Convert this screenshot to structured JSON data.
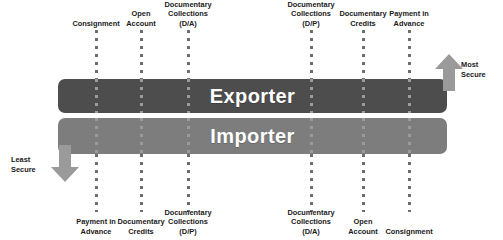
{
  "diagram": {
    "bars": {
      "exporter": {
        "label": "Exporter",
        "color": "#4d4d4d"
      },
      "importer": {
        "label": "Importer",
        "color": "#7d7d7d"
      }
    },
    "security_arrows": {
      "most_secure": {
        "line1": "Most",
        "line2": "Secure",
        "direction": "up",
        "color": "#9a9a9a"
      },
      "least_secure": {
        "line1": "Least",
        "line2": "Secure",
        "direction": "down",
        "color": "#9a9a9a"
      }
    },
    "exporter_labels": [
      {
        "x": 96,
        "lines": [
          "Consignment"
        ]
      },
      {
        "x": 141,
        "lines": [
          "Open",
          "Account"
        ]
      },
      {
        "x": 188,
        "lines": [
          "Documentary",
          "Collections",
          "(D/A)"
        ]
      },
      {
        "x": 311,
        "lines": [
          "Documentary",
          "Collections",
          "(D/P)"
        ]
      },
      {
        "x": 363,
        "lines": [
          "Documentary",
          "Credits"
        ]
      },
      {
        "x": 409,
        "lines": [
          "Payment in",
          "Advance"
        ]
      }
    ],
    "importer_labels": [
      {
        "x": 96,
        "lines": [
          "Payment in",
          "Advance"
        ]
      },
      {
        "x": 141,
        "lines": [
          "Documentary",
          "Credits"
        ]
      },
      {
        "x": 188,
        "lines": [
          "Documentary",
          "Collections",
          "(D/P)"
        ]
      },
      {
        "x": 311,
        "lines": [
          "Documentary",
          "Collections",
          "(D/A)"
        ]
      },
      {
        "x": 363,
        "lines": [
          "Open",
          "Account"
        ]
      },
      {
        "x": 409,
        "lines": [
          "Consignment"
        ]
      }
    ],
    "columns_x": [
      96,
      141,
      188,
      311,
      363,
      409
    ]
  }
}
